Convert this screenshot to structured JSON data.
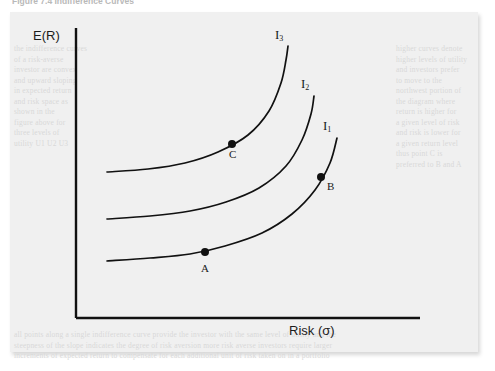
{
  "caption": "Figure 7.4  Indifference Curves",
  "panel": {
    "background_color": "#f0f0f0",
    "border_shadow": true
  },
  "axes": {
    "y_label": "E(R)",
    "x_label": "Risk (σ)",
    "line_color": "#111111",
    "origin": {
      "x": 76,
      "y": 318
    },
    "y_top": 28,
    "x_right": 420
  },
  "curves": [
    {
      "id": "I1",
      "label": "I",
      "subscript": "1",
      "points": [
        {
          "x": 107,
          "y": 261
        },
        {
          "x": 150,
          "y": 258
        },
        {
          "x": 190,
          "y": 254
        },
        {
          "x": 225,
          "y": 246
        },
        {
          "x": 262,
          "y": 233
        },
        {
          "x": 292,
          "y": 214
        },
        {
          "x": 315,
          "y": 190
        },
        {
          "x": 330,
          "y": 163
        },
        {
          "x": 337,
          "y": 138
        }
      ]
    },
    {
      "id": "I2",
      "label": "I",
      "subscript": "2",
      "points": [
        {
          "x": 107,
          "y": 219
        },
        {
          "x": 150,
          "y": 216
        },
        {
          "x": 190,
          "y": 211
        },
        {
          "x": 226,
          "y": 202
        },
        {
          "x": 259,
          "y": 188
        },
        {
          "x": 286,
          "y": 166
        },
        {
          "x": 302,
          "y": 140
        },
        {
          "x": 311,
          "y": 114
        },
        {
          "x": 314,
          "y": 96
        }
      ]
    },
    {
      "id": "I3",
      "label": "I",
      "subscript": "3",
      "points": [
        {
          "x": 107,
          "y": 172
        },
        {
          "x": 148,
          "y": 169
        },
        {
          "x": 185,
          "y": 163
        },
        {
          "x": 218,
          "y": 152
        },
        {
          "x": 248,
          "y": 135
        },
        {
          "x": 269,
          "y": 111
        },
        {
          "x": 281,
          "y": 83
        },
        {
          "x": 286,
          "y": 60
        },
        {
          "x": 288,
          "y": 46
        }
      ]
    }
  ],
  "points": [
    {
      "label": "A",
      "curve": "I1",
      "dot": {
        "x": 205,
        "y": 252
      },
      "label_pos": {
        "x": 201,
        "y": 262
      }
    },
    {
      "label": "B",
      "curve": "I1",
      "dot": {
        "x": 321,
        "y": 177
      },
      "label_pos": {
        "x": 327,
        "y": 180
      }
    },
    {
      "label": "C",
      "curve": "I3",
      "dot": {
        "x": 232,
        "y": 144
      },
      "label_pos": {
        "x": 229,
        "y": 148
      }
    }
  ],
  "chart_data": {
    "type": "line",
    "title": "Figure 7.4  Indifference Curves",
    "xlabel": "Risk (σ)",
    "ylabel": "E(R)",
    "grid": false,
    "legend": "inline-curve-labels",
    "xlim": [
      0,
      1
    ],
    "ylim": [
      0,
      1
    ],
    "annotations": [
      "A",
      "B",
      "C",
      "I1",
      "I2",
      "I3"
    ],
    "series": [
      {
        "name": "I1",
        "note": "lowest indifference curve; contains points A and B"
      },
      {
        "name": "I2",
        "note": "middle indifference curve"
      },
      {
        "name": "I3",
        "note": "highest indifference curve; contains point C"
      }
    ]
  },
  "bleed": {
    "left": "the indifference curves\nof a risk-averse\ninvestor are convex\nand upward sloping\nin expected return\nand risk space as\nshown in the\nfigure above for\nthree levels of\nutility U1 U2 U3",
    "right": "higher curves denote\nhigher levels of utility\nand investors prefer\nto move to the\nnorthwest portion of\nthe diagram where\nreturn is higher for\na given level of risk\nand risk is lower for\na given return level\nthus point C is\npreferred to B and A",
    "bottom": "all points along a single indifference curve provide the investor with the same level of utility and the\nsteepness of the slope indicates the degree of risk aversion more risk averse investors require larger\nincrements of expected return to compensate for each additional unit of risk taken on in a portfolio"
  }
}
